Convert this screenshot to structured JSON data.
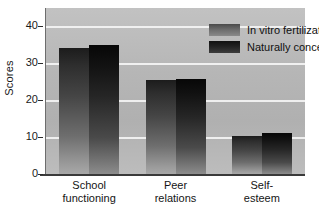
{
  "chart_data": {
    "type": "bar",
    "title": "",
    "xlabel": "",
    "ylabel": "Scores",
    "categories": [
      "School functioning",
      "Peer relations",
      "Self-esteem"
    ],
    "category_lines": [
      [
        "School",
        "functioning"
      ],
      [
        "Peer",
        "relations"
      ],
      [
        "Self-",
        "esteem"
      ]
    ],
    "series": [
      {
        "name": "In vitro fertilization",
        "values": [
          34.2,
          25.4,
          10.2
        ],
        "color": "#6b6b6b"
      },
      {
        "name": "Naturally conceived",
        "values": [
          35.0,
          25.8,
          11.0
        ],
        "color": "#222222"
      }
    ],
    "ylim": [
      0,
      45
    ],
    "yticks": [
      0,
      10,
      20,
      30,
      40
    ],
    "ytick_labels": [
      "0",
      "10",
      "20",
      "30",
      "40"
    ],
    "grid": true,
    "gridlines_at": [
      10,
      20,
      30,
      40
    ],
    "legend_position": "top-right",
    "plot_background": "#b6b6b6",
    "gridline_color": "#f2f2f2",
    "axis_color": "#2b2b2b"
  },
  "axis": {
    "y_label": "Scores"
  },
  "legend": {
    "entries": [
      {
        "label": "In vitro fertilization"
      },
      {
        "label": "Naturally conceived"
      }
    ]
  }
}
